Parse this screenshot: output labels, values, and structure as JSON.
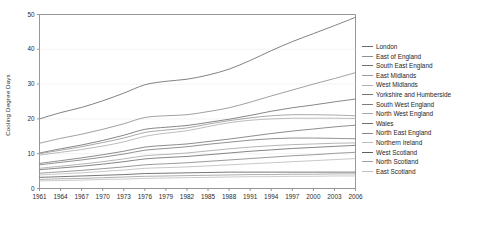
{
  "chart_data": {
    "type": "line",
    "title": "",
    "xlabel": "",
    "ylabel": "Cooling Degree Days",
    "xlim": [
      1961,
      2006
    ],
    "ylim": [
      0,
      50
    ],
    "yticks": [
      0,
      10,
      20,
      30,
      40,
      50
    ],
    "xticks": [
      1961,
      1964,
      1967,
      1970,
      1973,
      1976,
      1979,
      1982,
      1985,
      1988,
      1991,
      1994,
      1997,
      2000,
      2003,
      2006
    ],
    "grid": false,
    "legend_position": "right",
    "x": [
      1961,
      1964,
      1967,
      1970,
      1973,
      1976,
      1979,
      1982,
      1985,
      1988,
      1991,
      1994,
      1997,
      2000,
      2003,
      2006
    ],
    "series": [
      {
        "name": "London",
        "color": "#6b6b6b",
        "values": [
          20.0,
          21.8,
          23.3,
          25.2,
          27.4,
          29.8,
          30.8,
          31.4,
          32.6,
          34.3,
          36.8,
          39.6,
          42.2,
          44.5,
          46.8,
          49.2
        ]
      },
      {
        "name": "East of England",
        "color": "#8f8f8f",
        "values": [
          13.0,
          14.4,
          15.6,
          17.0,
          18.6,
          20.4,
          20.9,
          21.2,
          22.1,
          23.2,
          24.8,
          26.6,
          28.3,
          30.0,
          31.6,
          33.3
        ]
      },
      {
        "name": "South East England",
        "color": "#707070",
        "values": [
          10.2,
          11.4,
          12.5,
          13.8,
          15.3,
          17.0,
          17.6,
          18.1,
          19.0,
          19.9,
          21.0,
          22.2,
          23.2,
          24.0,
          24.9,
          25.7
        ]
      },
      {
        "name": "East Midlands",
        "color": "#9a9a9a",
        "values": [
          10.0,
          11.0,
          12.0,
          13.2,
          14.5,
          16.1,
          16.8,
          17.4,
          18.5,
          19.5,
          20.3,
          20.9,
          21.2,
          21.2,
          21.1,
          20.9
        ]
      },
      {
        "name": "West Midlands",
        "color": "#b0b0b0",
        "values": [
          9.6,
          10.4,
          11.2,
          12.2,
          13.4,
          15.0,
          15.9,
          16.6,
          17.8,
          18.9,
          19.6,
          20.0,
          20.2,
          20.2,
          20.2,
          20.1
        ]
      },
      {
        "name": "Yorkshire and Humberside",
        "color": "#777777",
        "values": [
          7.2,
          8.0,
          8.8,
          9.7,
          10.7,
          11.9,
          12.4,
          12.8,
          13.5,
          14.2,
          15.0,
          15.8,
          16.5,
          17.1,
          17.7,
          18.2
        ]
      },
      {
        "name": "South West England",
        "color": "#7d7d7d",
        "values": [
          6.8,
          7.5,
          8.2,
          9.0,
          9.9,
          11.0,
          11.5,
          12.0,
          12.7,
          13.3,
          13.9,
          14.3,
          14.5,
          14.5,
          14.4,
          14.3
        ]
      },
      {
        "name": "North West England",
        "color": "#a8a8a8",
        "values": [
          5.8,
          6.4,
          7.0,
          7.7,
          8.5,
          9.4,
          9.8,
          10.2,
          10.8,
          11.4,
          11.9,
          12.3,
          12.6,
          12.8,
          13.0,
          13.1
        ]
      },
      {
        "name": "Wales",
        "color": "#6f6f6f",
        "values": [
          5.4,
          5.9,
          6.4,
          7.0,
          7.7,
          8.5,
          8.9,
          9.2,
          9.7,
          10.2,
          10.7,
          11.1,
          11.5,
          11.8,
          12.1,
          12.4
        ]
      },
      {
        "name": "North East England",
        "color": "#888888",
        "values": [
          4.4,
          4.8,
          5.2,
          5.7,
          6.2,
          6.8,
          7.1,
          7.4,
          7.8,
          8.2,
          8.6,
          9.0,
          9.4,
          9.7,
          10.1,
          10.4
        ]
      },
      {
        "name": "Northern Ireland",
        "color": "#bdbdbd",
        "values": [
          3.9,
          4.2,
          4.5,
          4.9,
          5.3,
          5.8,
          6.0,
          6.2,
          6.5,
          6.8,
          7.1,
          7.4,
          7.7,
          8.0,
          8.3,
          8.6
        ]
      },
      {
        "name": "West Scotland",
        "color": "#5f5f5f",
        "values": [
          3.2,
          3.4,
          3.6,
          3.8,
          4.0,
          4.3,
          4.4,
          4.5,
          4.6,
          4.7,
          4.7,
          4.7,
          4.7,
          4.7,
          4.7,
          4.7
        ]
      },
      {
        "name": "North Scotland",
        "color": "#a0a0a0",
        "values": [
          2.6,
          2.8,
          2.9,
          3.1,
          3.3,
          3.5,
          3.6,
          3.7,
          3.8,
          3.9,
          4.0,
          4.0,
          4.1,
          4.1,
          4.2,
          4.2
        ]
      },
      {
        "name": "East Scotland",
        "color": "#c2c2c2",
        "values": [
          2.2,
          2.3,
          2.4,
          2.6,
          2.7,
          2.9,
          3.0,
          3.1,
          3.2,
          3.3,
          3.4,
          3.4,
          3.5,
          3.5,
          3.6,
          3.6
        ]
      }
    ]
  },
  "axis": {
    "frame_color": "#8a8a8a",
    "tick_color": "#2b2b2b"
  }
}
